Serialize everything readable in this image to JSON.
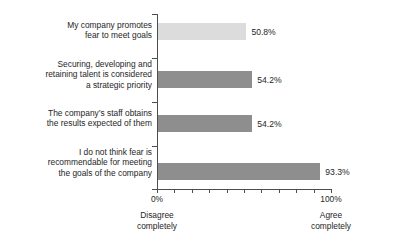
{
  "chart_data": {
    "type": "bar",
    "orientation": "horizontal",
    "title": "",
    "xlabel": "",
    "ylabel": "",
    "xlim": [
      0,
      100
    ],
    "grid": false,
    "legend": false,
    "categories": [
      "My company promotes\nfear to meet goals",
      "Securing, developing and\nretaining talent is considered\na strategic priority",
      "The company’s staff obtains\nthe results expected of them",
      "I do not think fear is\nrecommendable for meeting\nthe goals of the company"
    ],
    "values": [
      50.8,
      54.2,
      54.2,
      93.3
    ],
    "value_labels": [
      "50.8%",
      "54.2%",
      "54.2%",
      "93.3%"
    ],
    "bar_colors": [
      "#dcdcdc",
      "#8e8e8e",
      "#8e8e8e",
      "#8e8e8e"
    ],
    "axis": {
      "start_tick_label": "0%",
      "end_tick_label": "100%",
      "start_caption": "Disagree\ncompletely",
      "end_caption": "Agree\ncompletely",
      "tick_count": 11
    }
  },
  "colors": {
    "axis": "#4d4d4d",
    "text": "#262626",
    "bar_light": "#dcdcdc",
    "bar_dark": "#8e8e8e",
    "background": "#ffffff"
  }
}
